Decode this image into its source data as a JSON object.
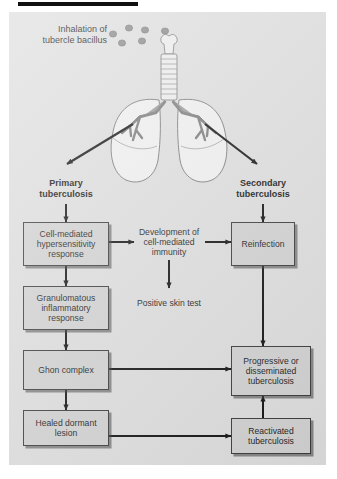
{
  "figure": {
    "title_bar": "",
    "background_color": "#dedede",
    "box_fill": "#d2d2d2",
    "box_border": "#3a3a3a",
    "arrow_color": "#111111",
    "bacillus_color": "#8a8a8a"
  },
  "caption": {
    "line1": "Inhalation of",
    "line2": "tubercle bacillus"
  },
  "anatomy": {
    "organ": "lungs-with-trachea-and-bronchi",
    "bacilli_count": 6
  },
  "stages": {
    "primary": {
      "line1": "Primary",
      "line2": "tuberculosis"
    },
    "secondary": {
      "line1": "Secondary",
      "line2": "tuberculosis"
    }
  },
  "nodes": {
    "cell_mediated_hypersensitivity": {
      "text": "Cell-mediated hypersensitivity response",
      "boxed": true
    },
    "granulomatous_inflammatory": {
      "text": "Granulomatous inflammatory response",
      "boxed": true
    },
    "ghon_complex": {
      "text": "Ghon complex",
      "boxed": true
    },
    "healed_dormant_lesion": {
      "text": "Healed dormant lesion",
      "boxed": true
    },
    "development_cell_mediated_immunity": {
      "text": "Development of cell-mediated immunity",
      "boxed": false
    },
    "positive_skin_test": {
      "text": "Positive skin test",
      "boxed": false
    },
    "reinfection": {
      "text": "Reinfection",
      "boxed": true
    },
    "progressive_disseminated": {
      "text": "Progressive or disseminated tuberculosis",
      "boxed": true
    },
    "reactivated": {
      "text": "Reactivated tuberculosis",
      "boxed": true
    }
  },
  "flow": {
    "edges": [
      "lungs->primary-tuberculosis",
      "lungs->secondary-tuberculosis",
      "primary-tuberculosis->cell-mediated-hypersensitivity",
      "cell-mediated-hypersensitivity->development-of-cell-mediated-immunity",
      "cell-mediated-hypersensitivity->granulomatous-inflammatory",
      "granulomatous-inflammatory->ghon-complex",
      "ghon-complex->healed-dormant-lesion",
      "ghon-complex->progressive-or-disseminated",
      "healed-dormant-lesion->reactivated",
      "development-of-cell-mediated-immunity->positive-skin-test",
      "development-of-cell-mediated-immunity->reinfection",
      "secondary-tuberculosis->reinfection",
      "reinfection->progressive-or-disseminated",
      "reactivated->progressive-or-disseminated"
    ]
  }
}
